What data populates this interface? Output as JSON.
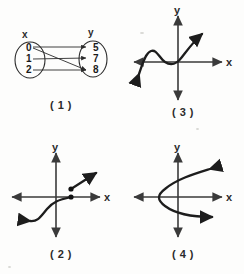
{
  "document": {
    "kind": "math-worksheet-figure",
    "description": "Four panels illustrating relations and functions"
  },
  "panels": [
    {
      "id": "panel-1",
      "caption": "( 1 )",
      "type": "mapping-diagram",
      "domain_label": "x",
      "range_label": "y",
      "domain_elements": [
        "0",
        "1",
        "2"
      ],
      "range_elements": [
        "5",
        "7",
        "8"
      ],
      "mappings": [
        {
          "from": "0",
          "to": "5"
        },
        {
          "from": "0",
          "to": "8"
        },
        {
          "from": "1",
          "to": "7"
        },
        {
          "from": "2",
          "to": "8"
        }
      ]
    },
    {
      "id": "panel-3",
      "caption": "( 3 )",
      "type": "graph",
      "x_axis_label": "x",
      "y_axis_label": "y",
      "curve_description": "cubic-like curve rising left to right with a local maximum and local minimum left of the origin"
    },
    {
      "id": "panel-2",
      "caption": "( 2 )",
      "type": "graph",
      "x_axis_label": "x",
      "y_axis_label": "y",
      "curve_description": "piecewise curve with a jump discontinuity marked by two closed dots, lower branch arrow to lower-left, upper ray arrow to upper-right",
      "closed_points": 2
    },
    {
      "id": "panel-4",
      "caption": "( 4 )",
      "type": "graph",
      "x_axis_label": "x",
      "y_axis_label": "y",
      "curve_description": "sideways parabola opening to the right with vertex left of the y-axis; both arms end in arrowheads"
    }
  ],
  "colors": {
    "ink": "#1d1d1d",
    "axis": "#3a3a3a",
    "paper": "#fdfdfc"
  }
}
